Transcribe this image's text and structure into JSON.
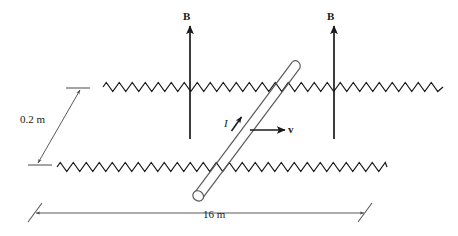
{
  "figure": {
    "background_color": "#ffffff",
    "stroke_color": "#1a1a1a"
  },
  "labels": {
    "b_field_left": "B",
    "b_field_right": "B",
    "current": "I",
    "velocity": "v",
    "rail_separation": "0.2 m",
    "rail_length": "16 m"
  },
  "chart_data": {
    "type": "diagram",
    "elements": [
      {
        "name": "upper-rail",
        "kind": "zigzag-resistor-line",
        "x_start": 103,
        "x_end": 443,
        "y_center": 87,
        "amplitude": 9,
        "period": 13
      },
      {
        "name": "lower-rail",
        "kind": "zigzag-resistor-line",
        "x_start": 57,
        "x_end": 387,
        "y_center": 167,
        "amplitude": 9,
        "period": 13
      },
      {
        "name": "magnetic-field-arrow-left",
        "kind": "arrow",
        "x": 190,
        "y_tail": 139,
        "y_head": 26,
        "direction": "up",
        "label": "B"
      },
      {
        "name": "magnetic-field-arrow-right",
        "kind": "arrow",
        "x": 334,
        "y_tail": 139,
        "y_head": 26,
        "direction": "up",
        "label": "B"
      },
      {
        "name": "sliding-rod",
        "kind": "cylinder",
        "x_bottom": 198,
        "y_bottom": 196,
        "x_top": 296,
        "y_top": 65,
        "diameter": 9
      },
      {
        "name": "velocity-arrow",
        "kind": "arrow",
        "x_tail": 250,
        "y_tail": 130,
        "x_head": 285,
        "y_head": 130,
        "direction": "right",
        "label": "v"
      },
      {
        "name": "current-arrow",
        "kind": "arrow",
        "x_tail": 231,
        "y_tail": 130,
        "x_head": 242,
        "y_head": 115,
        "direction": "up-right",
        "label": "I"
      },
      {
        "name": "rail-separation-dimension",
        "kind": "dimension-line",
        "x_start": 37,
        "y_start": 164,
        "x_end": 81,
        "y_end": 89,
        "value": "0.2 m"
      },
      {
        "name": "rail-length-dimension",
        "kind": "dimension-line",
        "x_start": 36,
        "y_start": 213,
        "x_end": 364,
        "y_end": 213,
        "value": "16 m"
      }
    ],
    "annotations": [
      "Magnetic field B points upward (in the plane of the page) at two locations.",
      "Rod slides to the right with velocity v.",
      "Induced current I flows along the rod toward the upper-right.",
      "Rail separation is 0.2 m; rail length is 16 m."
    ]
  }
}
